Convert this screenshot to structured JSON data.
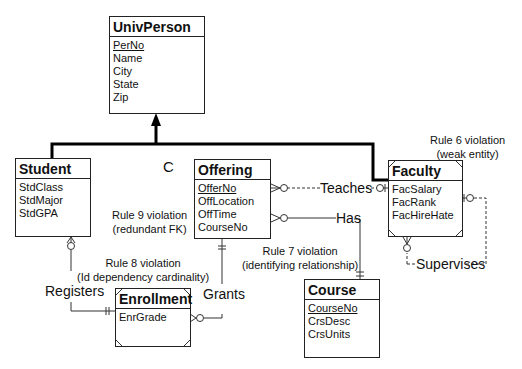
{
  "entities": {
    "univperson": {
      "title": "UnivPerson",
      "attrs": [
        "PerNo",
        "Name",
        "City",
        "State",
        "Zip"
      ],
      "pk": "PerNo"
    },
    "student": {
      "title": "Student",
      "attrs": [
        "StdClass",
        "StdMajor",
        "StdGPA"
      ]
    },
    "offering": {
      "title": "Offering",
      "attrs": [
        "OfferNo",
        "OffLocation",
        "OffTime",
        "CourseNo"
      ],
      "pk": "OfferNo"
    },
    "faculty": {
      "title": "Faculty",
      "attrs": [
        "FacSalary",
        "FacRank",
        "FacHireHate"
      ]
    },
    "enrollment": {
      "title": "Enrollment",
      "attrs": [
        "EnrGrade"
      ]
    },
    "course": {
      "title": "Course",
      "attrs": [
        "CourseNo",
        "CrsDesc",
        "CrsUnits"
      ],
      "pk": "CourseNo"
    }
  },
  "relationships": {
    "teaches": "Teaches",
    "has": "Has",
    "supervises": "Supervises",
    "registers": "Registers",
    "grants": "Grants"
  },
  "generalization": {
    "constraint": "C"
  },
  "notes": {
    "rule6": [
      "Rule 6 violation",
      "(weak entity)"
    ],
    "rule7": [
      "Rule 7 violation",
      "(identifying relationship)"
    ],
    "rule8": [
      "Rule 8 violation",
      "(Id dependency cardinality)"
    ],
    "rule9": [
      "Rule 9 violation",
      "(redundant FK)"
    ]
  }
}
